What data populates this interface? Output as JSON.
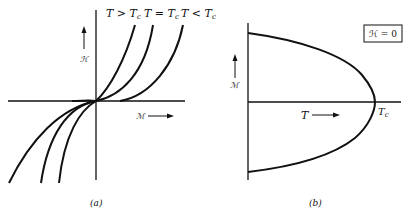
{
  "figure": {
    "panel_a": {
      "caption": "(a)",
      "curve_labels": {
        "above": "T > T",
        "equal": "T = T",
        "below": "T < T",
        "subscript": "c"
      },
      "y_axis_label": "ℋ",
      "x_axis_label": "ℳ",
      "description": "Magnetization isotherms H vs M for T > Tc, T = Tc, T < Tc"
    },
    "panel_b": {
      "caption": "(b)",
      "box_label": "ℋ = 0",
      "y_axis_label": "ℳ",
      "x_axis_label": "T",
      "tc_label_main": "T",
      "tc_label_sub": "c",
      "description": "Spontaneous magnetization M vs T at zero field, vanishing at Tc"
    },
    "colors": {
      "ink": "#111111",
      "background": "#ffffff"
    }
  }
}
